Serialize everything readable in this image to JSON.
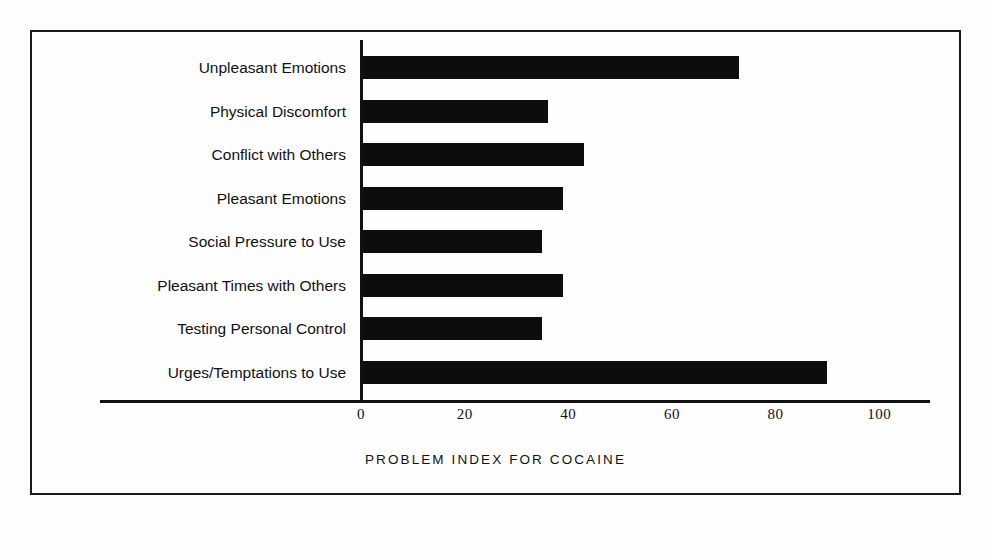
{
  "chart_data": {
    "type": "bar",
    "orientation": "horizontal",
    "title": "",
    "xlabel": "PROBLEM INDEX FOR COCAINE",
    "ylabel": "",
    "xlim": [
      0,
      110
    ],
    "xticks": [
      0,
      20,
      40,
      60,
      80,
      100
    ],
    "xtick_labels": [
      "0",
      "20",
      "40",
      "60",
      "80",
      "100"
    ],
    "grid": false,
    "legend": null,
    "bar_color": "#0d0d0d",
    "categories": [
      "Unpleasant Emotions",
      "Physical Discomfort",
      "Conflict with Others",
      "Pleasant Emotions",
      "Social Pressure to Use",
      "Pleasant Times with Others",
      "Testing Personal Control",
      "Urges/Temptations to Use"
    ],
    "values": [
      73,
      36,
      43,
      39,
      35,
      39,
      35,
      90
    ]
  },
  "figure": {
    "border_color": "#1a1a1a",
    "background": "#fefefe"
  }
}
